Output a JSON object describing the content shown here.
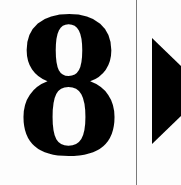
{
  "sign": {
    "digit": "8",
    "arrow_icon": "play-arrow-right",
    "colors": {
      "foreground": "#000000",
      "background": "#ffffff",
      "divider": "#7a7a7a"
    }
  }
}
